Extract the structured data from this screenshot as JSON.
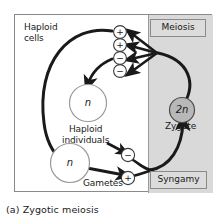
{
  "figure": {
    "caption": "(a) Zygotic meiosis"
  },
  "labels": {
    "haploid_cells": "Haploid\ncells",
    "haploid_individuals": "Haploid\nindividuals",
    "gametes": "Gametes",
    "zygote": "Zygote"
  },
  "tags": {
    "meiosis": "Meiosis",
    "syngamy": "Syngamy"
  },
  "cells": {
    "haploid_upper": "n",
    "haploid_lower": "n",
    "diploid_zygote": "2n"
  },
  "mating_types": {
    "meiotic_products": [
      "+",
      "+",
      "−",
      "−"
    ],
    "gamete_minus": "−",
    "gamete_plus": "+"
  },
  "colors": {
    "background": "#ffffff",
    "frame_border": "#8a8a8a",
    "shaded_panel": "#d9d9d9",
    "tag_fill": "#dcdcdc",
    "arrow": "#1a1a1a",
    "cell_outline": "#8a8a8a",
    "zygote_fill": "#b8b8b8",
    "text": "#1a1a1a"
  }
}
